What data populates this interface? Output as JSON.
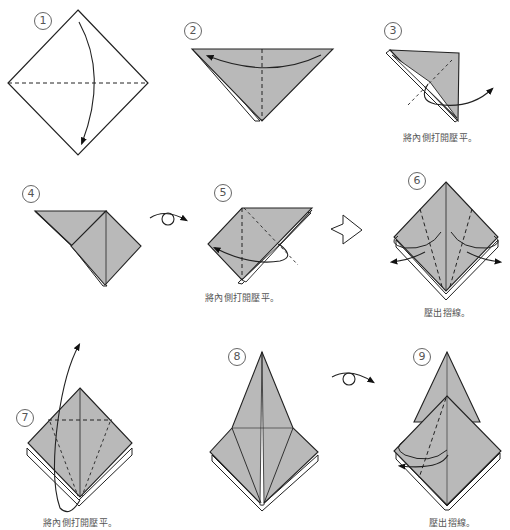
{
  "colors": {
    "paper_front": "#b9b9b9",
    "paper_back": "#ffffff",
    "line": "#222222",
    "caption": "#555555"
  },
  "steps": [
    {
      "number": "1",
      "caption": "",
      "instruction": "valley fold top corner down to bottom corner"
    },
    {
      "number": "2",
      "caption": "",
      "instruction": "valley fold right corner to left corner"
    },
    {
      "number": "3",
      "caption": "將內側打開壓平。",
      "instruction": "squash fold"
    },
    {
      "number": "4",
      "caption": "",
      "instruction": "turn over"
    },
    {
      "number": "5",
      "caption": "將內側打開壓平。",
      "instruction": "squash fold"
    },
    {
      "number": "6",
      "caption": "壓出摺線。",
      "instruction": "fold edges to center and unfold to crease"
    },
    {
      "number": "7",
      "caption": "將內側打開壓平。",
      "instruction": "petal fold upward"
    },
    {
      "number": "8",
      "caption": "",
      "instruction": "turn over"
    },
    {
      "number": "9",
      "caption": "壓出摺線。",
      "instruction": "fold and unfold to crease"
    }
  ],
  "symbols": {
    "turn_over": "turn-over-icon",
    "result_arrow": "hollow-arrow-icon"
  }
}
